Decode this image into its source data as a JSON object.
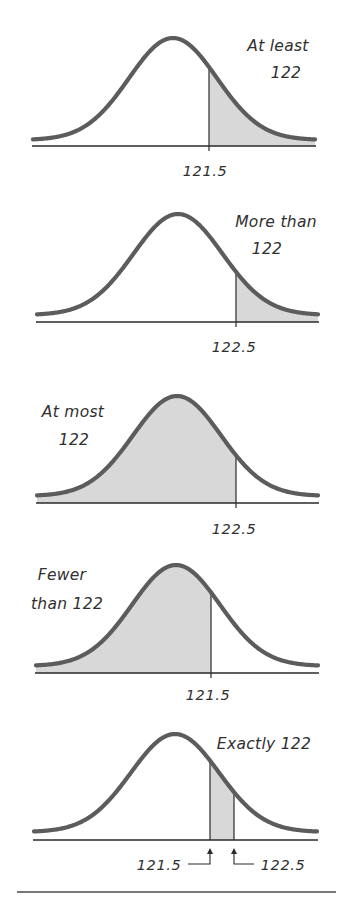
{
  "figure": {
    "panels": [
      {
        "id": "at-least",
        "label_lines": [
          "At least",
          "122"
        ],
        "label_pos": [
          [
            278,
            51
          ],
          [
            286,
            78
          ]
        ],
        "cx": 173,
        "sigma": 44,
        "peak_y": 38,
        "base_y": 140,
        "x0": 33,
        "x1": 315,
        "axis_y": 146,
        "shade": [
          209,
          315
        ],
        "cutoffs": [
          {
            "x": 209,
            "value": "121.5"
          }
        ],
        "tick_label_pos": [
          [
            205,
            176
          ]
        ]
      },
      {
        "id": "more-than",
        "label_lines": [
          "More than",
          "122"
        ],
        "label_pos": [
          [
            276,
            227
          ],
          [
            267,
            254
          ]
        ],
        "cx": 178,
        "sigma": 44.5,
        "peak_y": 214,
        "base_y": 315,
        "x0": 37,
        "x1": 318,
        "axis_y": 322,
        "shade": [
          236,
          318
        ],
        "cutoffs": [
          {
            "x": 236,
            "value": "122.5"
          }
        ],
        "tick_label_pos": [
          [
            234,
            352
          ]
        ]
      },
      {
        "id": "at-most",
        "label_lines": [
          "At most",
          "122"
        ],
        "label_pos": [
          [
            73,
            417
          ],
          [
            74,
            445
          ]
        ],
        "cx": 177,
        "sigma": 44,
        "peak_y": 396,
        "base_y": 496,
        "x0": 37,
        "x1": 318,
        "axis_y": 503,
        "shade": [
          37,
          236
        ],
        "cutoffs": [
          {
            "x": 236,
            "value": "122.5"
          }
        ],
        "tick_label_pos": [
          [
            234,
            534
          ]
        ]
      },
      {
        "id": "fewer-than",
        "label_lines": [
          "Fewer",
          "than 122"
        ],
        "label_pos": [
          [
            62,
            580
          ],
          [
            67,
            609
          ]
        ],
        "cx": 176,
        "sigma": 44,
        "peak_y": 565,
        "base_y": 666,
        "x0": 36,
        "x1": 318,
        "axis_y": 673,
        "shade": [
          36,
          211
        ],
        "cutoffs": [
          {
            "x": 211,
            "value": "121.5"
          }
        ],
        "tick_label_pos": [
          [
            208,
            700
          ]
        ]
      },
      {
        "id": "exactly",
        "label_lines": [
          "Exactly 122"
        ],
        "label_pos": [
          [
            264,
            749
          ]
        ],
        "cx": 175,
        "sigma": 44,
        "peak_y": 734,
        "base_y": 832,
        "x0": 34,
        "x1": 317,
        "axis_y": 840,
        "shade": [
          210,
          234
        ],
        "cutoffs": [
          {
            "x": 210,
            "value": "121.5"
          },
          {
            "x": 234,
            "value": "122.5"
          }
        ],
        "tick_label_pos": [
          [
            159,
            870
          ],
          [
            283,
            870
          ]
        ],
        "arrows": true
      }
    ],
    "colors": {
      "curve": "#5c5c5c",
      "shade": "#d8d8d8",
      "ink": "#2a2a2a"
    },
    "bottom_rule": {
      "x0": 17,
      "x1": 336,
      "y": 892
    }
  }
}
